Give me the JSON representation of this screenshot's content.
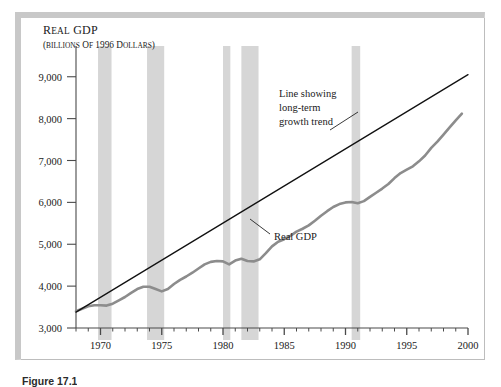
{
  "figure": {
    "caption": "Figure 17.1",
    "title_main": "Real GDP",
    "title_sub": "(billions of 1996 dollars)"
  },
  "annotations": {
    "trend": {
      "line1": "Line showing",
      "line2": "long-term",
      "line3": "growth trend"
    },
    "series": {
      "label": "Real GDP"
    }
  },
  "colors": {
    "gdp_line": "#8c8c8c",
    "trend_line": "#111111",
    "recession_band": "#d6d6d6",
    "axis": "#4a4a4a",
    "frame": "#c8c8c8",
    "background": "#ffffff"
  },
  "chart_data": {
    "type": "line",
    "title": "Real GDP",
    "subtitle": "(billions of 1996 dollars)",
    "xlabel": "",
    "ylabel": "Real GDP (billions of 1996 dollars)",
    "xlim": [
      1968,
      2000
    ],
    "ylim": [
      3000,
      9400
    ],
    "grid": false,
    "legend": "none",
    "y_ticks": [
      3000,
      4000,
      5000,
      6000,
      7000,
      8000,
      9000
    ],
    "y_tick_labels": [
      "3,000",
      "4,000",
      "5,000",
      "6,000",
      "7,000",
      "8,000",
      "9,000"
    ],
    "x_ticks_major": [
      1970,
      1975,
      1980,
      1985,
      1990,
      1995,
      2000
    ],
    "x_tick_labels": [
      "1970",
      "1975",
      "1980",
      "1985",
      "1990",
      "1995",
      "2000"
    ],
    "x_minor_tick_step": 1,
    "series": [
      {
        "name": "Real GDP",
        "color": "#8c8c8c",
        "width": 2.6,
        "x": [
          1968,
          1968.5,
          1969,
          1969.5,
          1970,
          1970.5,
          1971,
          1971.5,
          1972,
          1972.5,
          1973,
          1973.5,
          1974,
          1974.5,
          1975,
          1975.5,
          1976,
          1976.5,
          1977,
          1977.5,
          1978,
          1978.5,
          1979,
          1979.5,
          1980,
          1980.5,
          1981,
          1981.5,
          1982,
          1982.5,
          1983,
          1983.5,
          1984,
          1984.5,
          1985,
          1985.5,
          1986,
          1986.5,
          1987,
          1987.5,
          1988,
          1988.5,
          1989,
          1989.5,
          1990,
          1990.5,
          1991,
          1991.5,
          1992,
          1992.5,
          1993,
          1993.5,
          1994,
          1994.5,
          1995,
          1995.5,
          1996,
          1996.5,
          1997,
          1997.5,
          1998,
          1998.5,
          1999,
          1999.5
        ],
        "y": [
          3400,
          3460,
          3520,
          3545,
          3545,
          3535,
          3580,
          3660,
          3740,
          3840,
          3930,
          3985,
          3985,
          3930,
          3875,
          3930,
          4050,
          4150,
          4230,
          4320,
          4420,
          4520,
          4580,
          4600,
          4590,
          4520,
          4610,
          4655,
          4600,
          4590,
          4640,
          4790,
          4950,
          5060,
          5120,
          5200,
          5300,
          5370,
          5450,
          5560,
          5680,
          5790,
          5890,
          5960,
          6000,
          6010,
          5980,
          6030,
          6130,
          6230,
          6330,
          6440,
          6580,
          6700,
          6780,
          6860,
          6980,
          7120,
          7300,
          7450,
          7620,
          7790,
          7960,
          8120
        ],
        "note": "approximate annual/semiannual real GDP path, billions of 1996 dollars"
      },
      {
        "name": "Long-term growth trend",
        "color": "#111111",
        "width": 1.3,
        "x": [
          1968,
          2000
        ],
        "y": [
          3380,
          9050
        ],
        "note": "straight smooth trend line fitted through the real GDP path"
      }
    ],
    "shaded_regions": [
      {
        "label": "recession",
        "x0": 1969.8,
        "x1": 1970.9
      },
      {
        "label": "recession",
        "x0": 1973.8,
        "x1": 1975.2
      },
      {
        "label": "recession",
        "x0": 1980.0,
        "x1": 1980.6
      },
      {
        "label": "recession",
        "x0": 1981.5,
        "x1": 1982.9
      },
      {
        "label": "recession",
        "x0": 1990.5,
        "x1": 1991.2
      }
    ],
    "annotations": [
      {
        "text": "Line showing long-term growth trend",
        "x": 1988.5,
        "y": 7900
      },
      {
        "text": "Real GDP",
        "x": 1986.0,
        "y": 4620
      }
    ]
  }
}
